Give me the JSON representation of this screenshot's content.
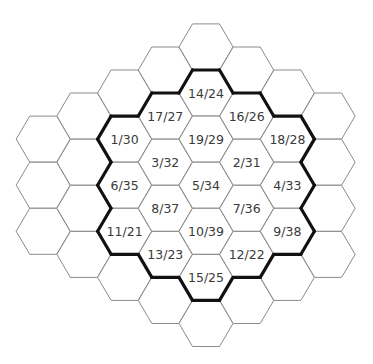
{
  "diagram": {
    "type": "hex-grid",
    "orientation": "flat-top",
    "colors": {
      "background": "#ffffff",
      "cell_stroke": "#8a8a8a",
      "boundary_stroke": "#111111",
      "label_text": "#3a3a3a"
    },
    "cells": [
      {
        "col": 0,
        "row": 6,
        "label": ""
      },
      {
        "col": 0,
        "row": 8,
        "label": ""
      },
      {
        "col": 0,
        "row": 10,
        "label": ""
      },
      {
        "col": 1,
        "row": 5,
        "label": ""
      },
      {
        "col": 1,
        "row": 7,
        "label": ""
      },
      {
        "col": 1,
        "row": 9,
        "label": ""
      },
      {
        "col": 1,
        "row": 11,
        "label": ""
      },
      {
        "col": 2,
        "row": 4,
        "label": ""
      },
      {
        "col": 2,
        "row": 6,
        "label": "1/30"
      },
      {
        "col": 2,
        "row": 8,
        "label": "6/35"
      },
      {
        "col": 2,
        "row": 10,
        "label": "11/21"
      },
      {
        "col": 2,
        "row": 12,
        "label": ""
      },
      {
        "col": 3,
        "row": 3,
        "label": ""
      },
      {
        "col": 3,
        "row": 5,
        "label": "17/27"
      },
      {
        "col": 3,
        "row": 7,
        "label": "3/32"
      },
      {
        "col": 3,
        "row": 9,
        "label": "8/37"
      },
      {
        "col": 3,
        "row": 11,
        "label": "13/23"
      },
      {
        "col": 3,
        "row": 13,
        "label": ""
      },
      {
        "col": 4,
        "row": 2,
        "label": ""
      },
      {
        "col": 4,
        "row": 4,
        "label": "14/24"
      },
      {
        "col": 4,
        "row": 6,
        "label": "19/29"
      },
      {
        "col": 4,
        "row": 8,
        "label": "5/34"
      },
      {
        "col": 4,
        "row": 10,
        "label": "10/39"
      },
      {
        "col": 4,
        "row": 12,
        "label": "15/25"
      },
      {
        "col": 4,
        "row": 14,
        "label": ""
      },
      {
        "col": 5,
        "row": 3,
        "label": ""
      },
      {
        "col": 5,
        "row": 5,
        "label": "16/26"
      },
      {
        "col": 5,
        "row": 7,
        "label": "2/31"
      },
      {
        "col": 5,
        "row": 9,
        "label": "7/36"
      },
      {
        "col": 5,
        "row": 11,
        "label": "12/22"
      },
      {
        "col": 5,
        "row": 13,
        "label": ""
      },
      {
        "col": 6,
        "row": 4,
        "label": ""
      },
      {
        "col": 6,
        "row": 6,
        "label": "18/28"
      },
      {
        "col": 6,
        "row": 8,
        "label": "4/33"
      },
      {
        "col": 6,
        "row": 10,
        "label": "9/38"
      },
      {
        "col": 6,
        "row": 12,
        "label": ""
      },
      {
        "col": 7,
        "row": 5,
        "label": ""
      },
      {
        "col": 7,
        "row": 7,
        "label": ""
      },
      {
        "col": 7,
        "row": 9,
        "label": ""
      },
      {
        "col": 7,
        "row": 11,
        "label": ""
      }
    ],
    "labeled_region_note": "Thick outline surrounds the 19 labeled cells"
  }
}
